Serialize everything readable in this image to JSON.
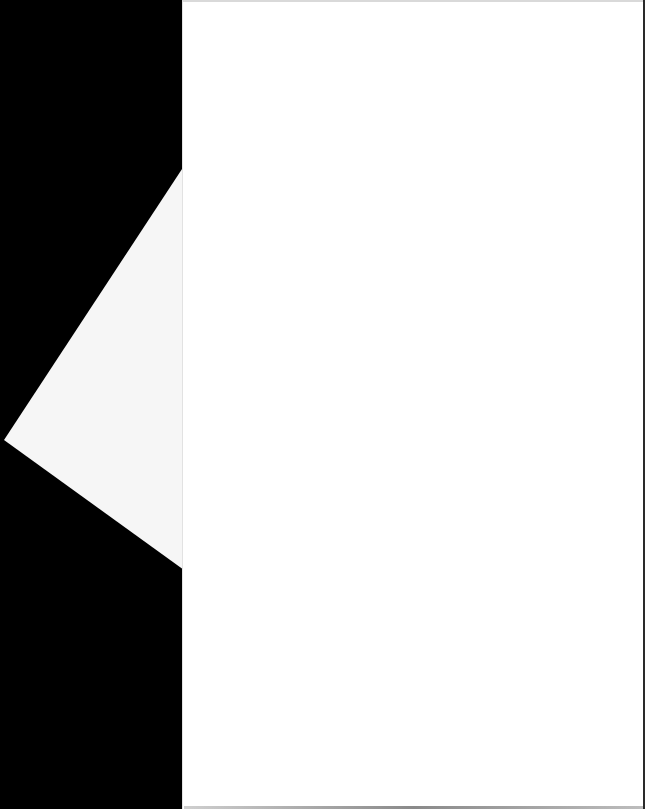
{
  "scene": {
    "description": "Blank white paper sheet with a folded triangular flap on a black background",
    "background_color": "#000000",
    "sheet_color": "#ffffff",
    "flap_color": "#f6f6f6",
    "text_content": []
  }
}
